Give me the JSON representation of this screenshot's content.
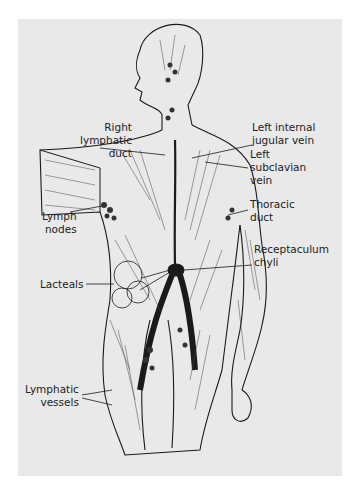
{
  "figure": {
    "background": "#e9e9e9",
    "ink": "#1a1a1a",
    "labels": [
      {
        "id": "right-lymphatic-duct",
        "text": "Right\nlymphatic\nduct"
      },
      {
        "id": "left-internal-jugular-vein",
        "text": "Left internal\njugular vein"
      },
      {
        "id": "left-subclavian-vein",
        "text": "Left\nsubclavian\nvein"
      },
      {
        "id": "thoracic-duct",
        "text": "Thoracic\nduct"
      },
      {
        "id": "lymph-nodes",
        "text": "Lymph\nnodes"
      },
      {
        "id": "receptaculum-chyli",
        "text": "Receptaculum\nchyli"
      },
      {
        "id": "lacteals",
        "text": "Lacteals"
      },
      {
        "id": "lymphatic-vessels",
        "text": "Lymphatic\nvessels"
      }
    ]
  }
}
